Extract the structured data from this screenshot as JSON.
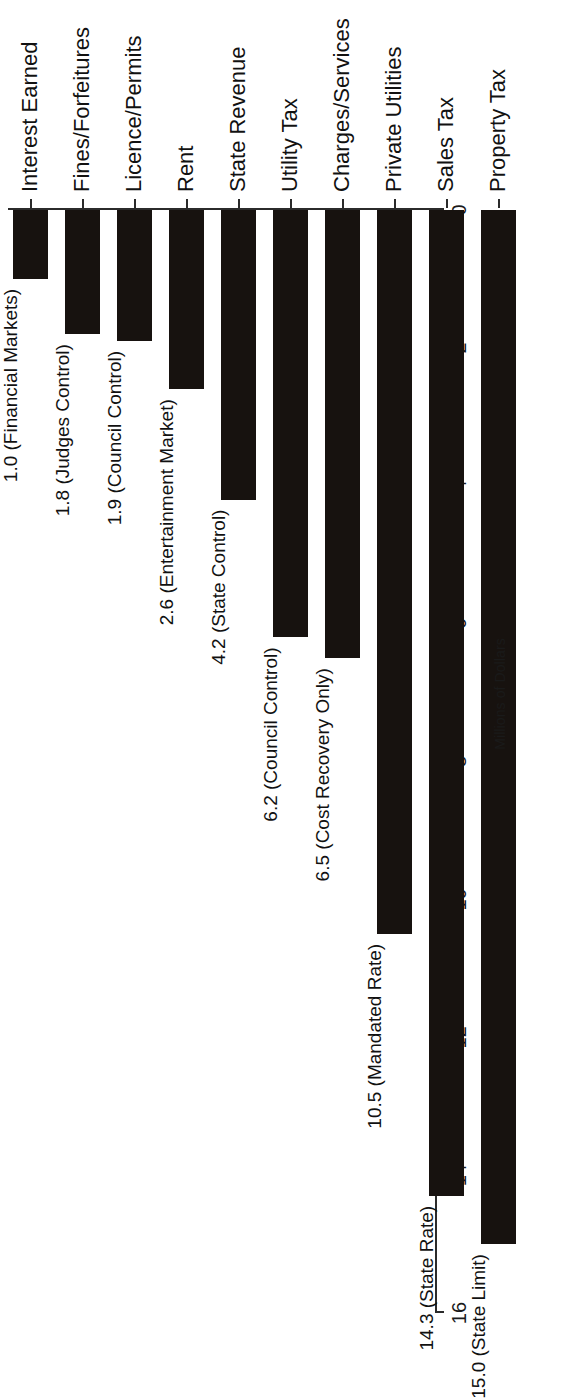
{
  "chart_data": {
    "type": "bar",
    "orientation": "vertical-rotated",
    "title": "",
    "subtitle": "",
    "xlabel": "",
    "ylabel": "Millions of Dollars",
    "axis_title": "Millions of Dollars",
    "ylim": [
      0,
      16
    ],
    "grid": false,
    "legend": null,
    "tick_labels": [
      "0",
      "2",
      "4",
      "6",
      "8",
      "10",
      "12",
      "14",
      "16"
    ],
    "ticks": [
      0,
      2,
      4,
      6,
      8,
      10,
      12,
      14,
      16
    ],
    "categories": [
      "Interest Earned",
      "Fines/Forfeitures",
      "Licence/Permits",
      "Rent",
      "State Revenue",
      "Utility Tax",
      "Charges/Services",
      "Private Utilities",
      "Sales Tax",
      "Property Tax"
    ],
    "values": [
      1.0,
      1.8,
      1.9,
      2.6,
      4.2,
      6.2,
      6.5,
      10.5,
      14.3,
      15.0
    ],
    "annotations": [
      "1.0 (Financial Markets)",
      "1.8 (Judges Control)",
      "1.9 (Council Control)",
      "2.6 (Entertainment Market)",
      "4.2 (State Control)",
      "6.2 (Council Control)",
      "6.5 (Cost Recovery Only)",
      "10.5 (Mandated Rate)",
      "14.3 (State Rate)",
      "15.0 (State Limit)"
    ],
    "colors": {
      "bar": "#17120f",
      "axis": "#2b2b2b",
      "text": "#111111",
      "background": "#ffffff"
    }
  }
}
